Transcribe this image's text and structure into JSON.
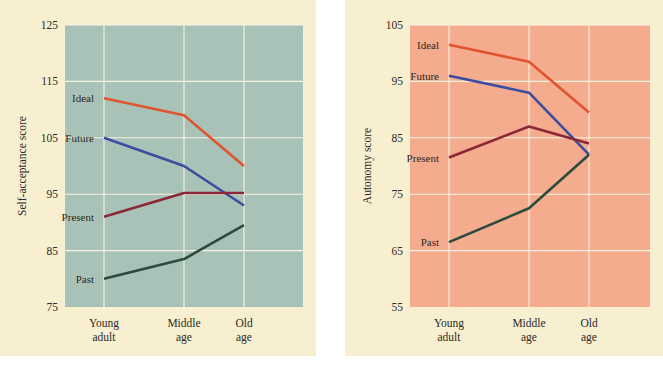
{
  "page": {
    "background_color": "#ffffff",
    "card_color": "#f7efd0"
  },
  "chart_data": [
    {
      "id": "self-acceptance",
      "type": "line",
      "title": "",
      "xlabel": "",
      "ylabel": "Self-acceptance score",
      "categories": [
        "Young adult",
        "Middle age",
        "Old age"
      ],
      "category_lines": [
        [
          "Young",
          "adult"
        ],
        [
          "Middle",
          "age"
        ],
        [
          "Old",
          "age"
        ]
      ],
      "ylim": [
        75,
        125
      ],
      "yticks": [
        75,
        85,
        95,
        105,
        115,
        125
      ],
      "grid": true,
      "legend_position": "inline-left",
      "plot_background": "#a9c2b8",
      "series": [
        {
          "name": "Ideal",
          "color": "#e0542e",
          "values": [
            112.0,
            109.0,
            100.0
          ]
        },
        {
          "name": "Future",
          "color": "#3a4d9e",
          "values": [
            105.0,
            100.0,
            93.0
          ]
        },
        {
          "name": "Present",
          "color": "#8b2838",
          "values": [
            91.0,
            95.2,
            95.2
          ]
        },
        {
          "name": "Past",
          "color": "#2d4a3e",
          "values": [
            80.0,
            83.5,
            89.5
          ]
        }
      ]
    },
    {
      "id": "autonomy",
      "type": "line",
      "title": "",
      "xlabel": "",
      "ylabel": "Autonomy score",
      "categories": [
        "Young adult",
        "Middle age",
        "Old age"
      ],
      "category_lines": [
        [
          "Young",
          "adult"
        ],
        [
          "Middle",
          "age"
        ],
        [
          "Old",
          "age"
        ]
      ],
      "ylim": [
        55,
        105
      ],
      "yticks": [
        55,
        65,
        75,
        85,
        95,
        105
      ],
      "grid": true,
      "legend_position": "inline-left",
      "plot_background": "#f4ab8e",
      "series": [
        {
          "name": "Ideal",
          "color": "#e0542e",
          "values": [
            101.5,
            98.5,
            89.5
          ]
        },
        {
          "name": "Future",
          "color": "#3a4d9e",
          "values": [
            96.0,
            93.0,
            82.0
          ]
        },
        {
          "name": "Present",
          "color": "#8b2838",
          "values": [
            81.5,
            87.0,
            84.0
          ]
        },
        {
          "name": "Past",
          "color": "#2d4a3e",
          "values": [
            66.5,
            72.5,
            82.0
          ]
        }
      ]
    }
  ]
}
